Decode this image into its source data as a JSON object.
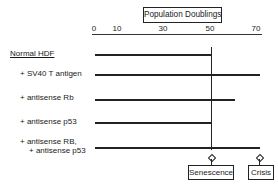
{
  "axis": {
    "title": "Population Doublings",
    "ticks": [
      {
        "label": "0",
        "x": 94
      },
      {
        "label": "10",
        "x": 117
      },
      {
        "label": "30",
        "x": 163
      },
      {
        "label": "50",
        "x": 210
      },
      {
        "label": "70",
        "x": 256
      }
    ]
  },
  "rows": [
    {
      "label": "Normal HDF",
      "end": "senescence",
      "end_pd": 50
    },
    {
      "label": "+ SV40 T antigen",
      "end": "crisis",
      "end_pd": 70
    },
    {
      "label": "+ antisense Rb",
      "end": "partial",
      "end_pd": 60
    },
    {
      "label": "+ antisense p53",
      "end": "senescence",
      "end_pd": 50
    },
    {
      "label": "+ antisense RB,",
      "label2": "+ antisense p53",
      "end": "crisis",
      "end_pd": 70
    }
  ],
  "outcomes": {
    "senescence": "Senescence",
    "crisis": "Crisis"
  },
  "colors": {
    "line": "#222222",
    "background": "#ffffff"
  }
}
